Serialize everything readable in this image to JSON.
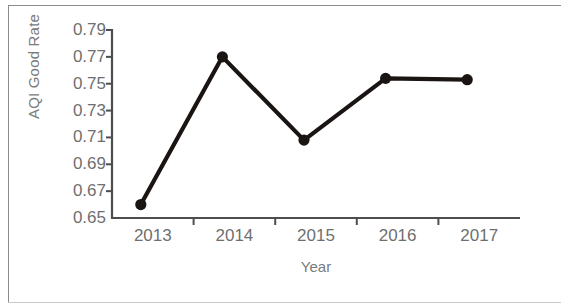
{
  "chart_data": {
    "type": "line",
    "title": "",
    "xlabel": "Year",
    "ylabel": "AQI Good Rate",
    "categories": [
      "2013",
      "2014",
      "2015",
      "2016",
      "2017"
    ],
    "values": [
      0.66,
      0.77,
      0.708,
      0.754,
      0.753
    ],
    "series": [
      {
        "name": "AQI Good Rate",
        "values": [
          0.66,
          0.77,
          0.708,
          0.754,
          0.753
        ]
      }
    ],
    "ylim": [
      0.65,
      0.79
    ],
    "ytick_labels": [
      "0.79",
      "0.77",
      "0.75",
      "0.73",
      "0.71",
      "0.69",
      "0.67",
      "0.65"
    ],
    "ytick_values": [
      0.79,
      0.77,
      0.75,
      0.73,
      0.71,
      0.69,
      0.67,
      0.65
    ],
    "xtick_labels": [
      "2013",
      "2014",
      "2015",
      "2016",
      "2017"
    ],
    "grid": false,
    "legend": false,
    "legend_position": "none",
    "line_color": "#1a1512",
    "marker_color": "#1a1512",
    "marker": "circle",
    "axis_color": "#4d4d4d",
    "text_color": "#6f6f6f",
    "background": "#ffffff"
  }
}
